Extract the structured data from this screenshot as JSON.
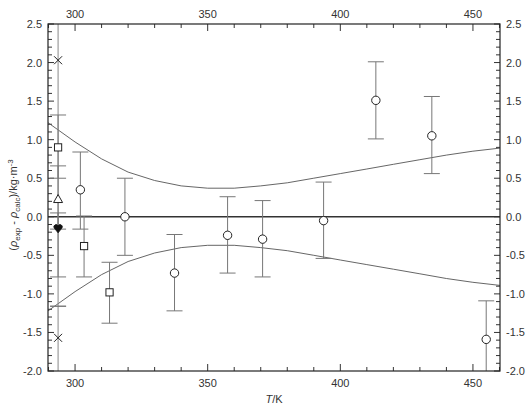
{
  "chart_data": {
    "type": "scatter",
    "title": "",
    "xlabel": "T/K",
    "ylabel": "(ρexp - ρcalc)/kg·m-3",
    "xlim": [
      289.8,
      460.2
    ],
    "ylim": [
      -2.0,
      2.5
    ],
    "x_ticks_major": [
      300,
      350,
      400,
      450
    ],
    "x_tick_labels": [
      "300",
      "350",
      "400",
      "450"
    ],
    "y_ticks_major": [
      -2.0,
      -1.5,
      -1.0,
      -0.5,
      0.0,
      0.5,
      1.0,
      1.5,
      2.0,
      2.5
    ],
    "y_tick_labels": [
      "-2.0",
      "-1.5",
      "-1.0",
      "-0.5",
      "0.0",
      "0.5",
      "1.0",
      "1.5",
      "2.0",
      "2.5"
    ],
    "mirror_axes": true,
    "grid": false,
    "legend": null,
    "zero_line": 0.0,
    "reference_vertical_line": 293.6,
    "series": [
      {
        "name": "circles",
        "marker": "open-circle",
        "points": [
          {
            "x": 302.0,
            "y": 0.35,
            "y_low": -0.16,
            "y_high": 0.84
          },
          {
            "x": 318.8,
            "y": 0.0,
            "y_low": -0.5,
            "y_high": 0.5
          },
          {
            "x": 337.5,
            "y": -0.73,
            "y_low": -1.22,
            "y_high": -0.23
          },
          {
            "x": 357.5,
            "y": -0.24,
            "y_low": -0.73,
            "y_high": 0.26
          },
          {
            "x": 370.7,
            "y": -0.29,
            "y_low": -0.78,
            "y_high": 0.21
          },
          {
            "x": 393.7,
            "y": -0.05,
            "y_low": -0.54,
            "y_high": 0.45
          },
          {
            "x": 413.4,
            "y": 1.51,
            "y_low": 1.01,
            "y_high": 2.01
          },
          {
            "x": 434.5,
            "y": 1.05,
            "y_low": 0.56,
            "y_high": 1.56
          },
          {
            "x": 455.0,
            "y": -1.59,
            "y_low": -2.0,
            "y_high": -1.09
          }
        ]
      },
      {
        "name": "squares",
        "marker": "open-square",
        "points": [
          {
            "x": 293.6,
            "y": 0.9,
            "y_low": 0.5,
            "y_high": 1.32
          },
          {
            "x": 303.4,
            "y": -0.38,
            "y_low": -0.78,
            "y_high": 0.01
          },
          {
            "x": 313.0,
            "y": -0.98,
            "y_low": -1.38,
            "y_high": -0.59
          }
        ]
      },
      {
        "name": "triangle",
        "marker": "open-triangle",
        "points": [
          {
            "x": 293.6,
            "y": 0.23,
            "y_low": -0.16,
            "y_high": 0.66
          }
        ]
      },
      {
        "name": "filled-heart",
        "marker": "filled-heart",
        "points": [
          {
            "x": 293.6,
            "y": -0.15,
            "y_low": -0.78,
            "y_high": 0.05
          }
        ]
      },
      {
        "name": "crosses",
        "marker": "cross",
        "points": [
          {
            "x": 293.6,
            "y": 2.03
          },
          {
            "x": 293.6,
            "y": -1.57,
            "y_low": -1.16,
            "y_high": -1.16
          }
        ]
      }
    ],
    "uncertainty_band": {
      "name": "uncertainty envelope",
      "upper": [
        {
          "x": 289.8,
          "y": 1.22
        },
        {
          "x": 300,
          "y": 0.97
        },
        {
          "x": 310,
          "y": 0.75
        },
        {
          "x": 320,
          "y": 0.58
        },
        {
          "x": 330,
          "y": 0.47
        },
        {
          "x": 340,
          "y": 0.4
        },
        {
          "x": 350,
          "y": 0.37
        },
        {
          "x": 360,
          "y": 0.37
        },
        {
          "x": 370,
          "y": 0.4
        },
        {
          "x": 380,
          "y": 0.44
        },
        {
          "x": 390,
          "y": 0.5
        },
        {
          "x": 400,
          "y": 0.56
        },
        {
          "x": 410,
          "y": 0.62
        },
        {
          "x": 420,
          "y": 0.68
        },
        {
          "x": 430,
          "y": 0.74
        },
        {
          "x": 440,
          "y": 0.8
        },
        {
          "x": 450,
          "y": 0.85
        },
        {
          "x": 460.2,
          "y": 0.89
        }
      ]
    }
  }
}
